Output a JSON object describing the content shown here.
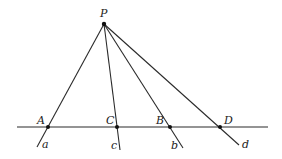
{
  "diagram": {
    "title": "",
    "points": {
      "P": {
        "label": "P",
        "x": 104,
        "y": 24
      },
      "A": {
        "label": "A",
        "x": 48,
        "y": 127
      },
      "C": {
        "label": "C",
        "x": 117,
        "y": 127
      },
      "B": {
        "label": "B",
        "x": 170,
        "y": 127
      },
      "D": {
        "label": "D",
        "x": 220,
        "y": 127
      }
    },
    "lines": {
      "a": {
        "label": "a"
      },
      "c": {
        "label": "c"
      },
      "b": {
        "label": "b"
      },
      "d": {
        "label": "d"
      }
    },
    "baseline": {
      "x1": 17,
      "x2": 268,
      "y": 127
    },
    "colors": {
      "stroke": "#2a2a2a",
      "text": "#222222"
    }
  }
}
